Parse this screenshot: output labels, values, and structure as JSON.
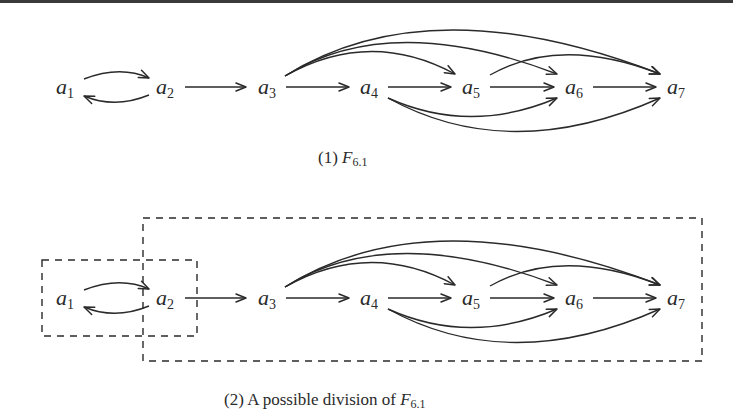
{
  "figure": {
    "panels": [
      {
        "id": "panel-1",
        "caption": {
          "prefix": "(1) ",
          "symbol": "F",
          "subscript": "6.1"
        },
        "nodes": [
          {
            "id": "a1",
            "base": "a",
            "sub": "1"
          },
          {
            "id": "a2",
            "base": "a",
            "sub": "2"
          },
          {
            "id": "a3",
            "base": "a",
            "sub": "3"
          },
          {
            "id": "a4",
            "base": "a",
            "sub": "4"
          },
          {
            "id": "a5",
            "base": "a",
            "sub": "5"
          },
          {
            "id": "a6",
            "base": "a",
            "sub": "6"
          },
          {
            "id": "a7",
            "base": "a",
            "sub": "7"
          }
        ],
        "edges": [
          [
            "a1",
            "a2"
          ],
          [
            "a2",
            "a1"
          ],
          [
            "a2",
            "a3"
          ],
          [
            "a3",
            "a4"
          ],
          [
            "a4",
            "a5"
          ],
          [
            "a5",
            "a6"
          ],
          [
            "a6",
            "a7"
          ],
          [
            "a3",
            "a5"
          ],
          [
            "a3",
            "a6"
          ],
          [
            "a3",
            "a7"
          ],
          [
            "a5",
            "a7"
          ],
          [
            "a4",
            "a6"
          ],
          [
            "a4",
            "a7"
          ]
        ]
      },
      {
        "id": "panel-2",
        "caption": {
          "prefix": "(2) A possible division of ",
          "symbol": "F",
          "subscript": "6.1"
        },
        "nodes": [
          {
            "id": "a1",
            "base": "a",
            "sub": "1"
          },
          {
            "id": "a2",
            "base": "a",
            "sub": "2"
          },
          {
            "id": "a3",
            "base": "a",
            "sub": "3"
          },
          {
            "id": "a4",
            "base": "a",
            "sub": "4"
          },
          {
            "id": "a5",
            "base": "a",
            "sub": "5"
          },
          {
            "id": "a6",
            "base": "a",
            "sub": "6"
          },
          {
            "id": "a7",
            "base": "a",
            "sub": "7"
          }
        ],
        "groups": [
          {
            "id": "group-small",
            "members": [
              "a1",
              "a2"
            ],
            "style": "dashed"
          },
          {
            "id": "group-large",
            "members": [
              "a2",
              "a3",
              "a4",
              "a5",
              "a6",
              "a7"
            ],
            "style": "dashed"
          }
        ]
      }
    ],
    "colors": {
      "stroke": "#2a2a2a",
      "background": "#ffffff"
    }
  }
}
